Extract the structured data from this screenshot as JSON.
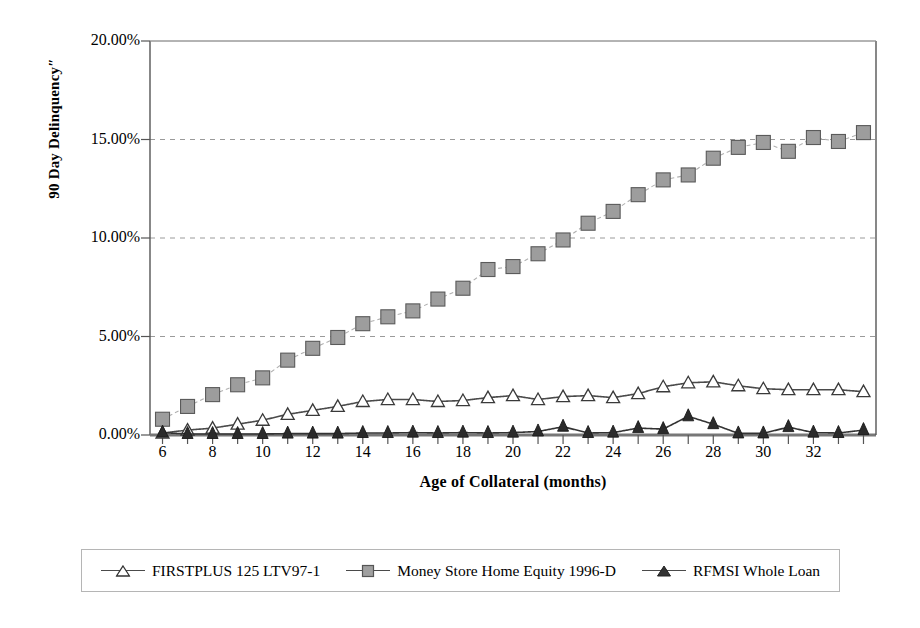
{
  "chart_data": {
    "type": "line",
    "title": "",
    "xlabel": "Age of Collateral (months)",
    "ylabel": "90 Day Delinquency″",
    "xlim": [
      5.5,
      34.5
    ],
    "ylim": [
      0,
      20
    ],
    "grid": true,
    "grid_axis": "y",
    "legend_position": "bottom",
    "y_tick_labels": [
      "0.00%",
      "5.00%",
      "10.00%",
      "15.00%",
      "20.00%"
    ],
    "y_tick_values": [
      0,
      5,
      10,
      15,
      20
    ],
    "x_tick_values": [
      6,
      7,
      8,
      9,
      10,
      11,
      12,
      13,
      14,
      15,
      16,
      17,
      18,
      19,
      20,
      21,
      22,
      23,
      24,
      25,
      26,
      27,
      28,
      29,
      30,
      31,
      32,
      33,
      34
    ],
    "x_tick_labels": [
      "6",
      "8",
      "10",
      "12",
      "14",
      "16",
      "18",
      "20",
      "22",
      "24",
      "26",
      "28",
      "30",
      "32"
    ],
    "x_labeled_values": [
      6,
      8,
      10,
      12,
      14,
      16,
      18,
      20,
      22,
      24,
      26,
      28,
      30,
      32
    ],
    "x": [
      6,
      7,
      8,
      9,
      10,
      11,
      12,
      13,
      14,
      15,
      16,
      17,
      18,
      19,
      20,
      21,
      22,
      23,
      24,
      25,
      26,
      27,
      28,
      29,
      30,
      31,
      32,
      33,
      34
    ],
    "series": [
      {
        "name": "FIRSTPLUS 125 LTV97-1",
        "marker": "triangle-open",
        "color": "#4a4a4a",
        "values": [
          0.1,
          0.25,
          0.35,
          0.55,
          0.75,
          1.05,
          1.25,
          1.45,
          1.7,
          1.8,
          1.8,
          1.7,
          1.75,
          1.9,
          2.0,
          1.8,
          1.95,
          2.0,
          1.9,
          2.1,
          2.45,
          2.65,
          2.7,
          2.5,
          2.35,
          2.3,
          2.3,
          2.3,
          2.2
        ]
      },
      {
        "name": "Money Store Home Equity 1996-D",
        "marker": "square-filled",
        "color": "#999999",
        "values": [
          0.8,
          1.45,
          2.05,
          2.55,
          2.9,
          3.8,
          4.4,
          4.95,
          5.65,
          6.0,
          6.3,
          6.9,
          7.45,
          8.4,
          8.55,
          9.2,
          9.9,
          10.75,
          11.35,
          12.2,
          12.95,
          13.2,
          14.05,
          14.6,
          14.85,
          14.4,
          15.1,
          14.9,
          15.35
        ]
      },
      {
        "name": "RFMSI  Whole Loan",
        "marker": "triangle-filled",
        "color": "#333333",
        "values": [
          0.12,
          0.05,
          0.05,
          0.05,
          0.05,
          0.07,
          0.07,
          0.07,
          0.1,
          0.1,
          0.12,
          0.1,
          0.12,
          0.1,
          0.12,
          0.18,
          0.42,
          0.1,
          0.12,
          0.35,
          0.3,
          0.95,
          0.55,
          0.08,
          0.08,
          0.4,
          0.12,
          0.1,
          0.25
        ]
      }
    ]
  },
  "legend": {
    "entries": [
      {
        "label": "FIRSTPLUS 125 LTV97-1",
        "marker": "triangle-open-marker"
      },
      {
        "label": "Money Store Home Equity 1996-D",
        "marker": "square-marker"
      },
      {
        "label": "RFMSI  Whole Loan",
        "marker": "triangle-filled-marker"
      }
    ]
  },
  "colors": {
    "axis": "#555555",
    "grid": "#9a9a9a",
    "series_open_triangle": "#4a4a4a",
    "series_square_fill": "#999999",
    "series_square_edge": "#555555",
    "series_filled_triangle": "#333333",
    "legend_border": "#b5b5b5",
    "background": "#ffffff"
  }
}
